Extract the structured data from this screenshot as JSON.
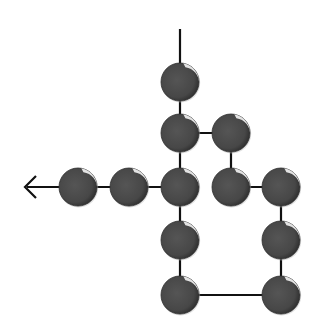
{
  "diagram": {
    "type": "node-chain",
    "width": 324,
    "height": 336,
    "colors": {
      "background": "#ffffff",
      "node_fill": "#4a4a4a",
      "node_dark": "#2e2e2e",
      "node_highlight": "#ffffff",
      "edge": "#111111"
    },
    "node_radius": 19,
    "nodes": [
      {
        "id": "n1",
        "x": 180,
        "y": 82
      },
      {
        "id": "n2",
        "x": 180,
        "y": 133
      },
      {
        "id": "n3",
        "x": 231,
        "y": 133
      },
      {
        "id": "n4",
        "x": 78,
        "y": 187
      },
      {
        "id": "n5",
        "x": 129,
        "y": 187
      },
      {
        "id": "n6",
        "x": 180,
        "y": 187
      },
      {
        "id": "n7",
        "x": 231,
        "y": 187
      },
      {
        "id": "n8",
        "x": 281,
        "y": 187
      },
      {
        "id": "n9",
        "x": 180,
        "y": 240
      },
      {
        "id": "n10",
        "x": 281,
        "y": 240
      },
      {
        "id": "n11",
        "x": 180,
        "y": 295
      },
      {
        "id": "n12",
        "x": 281,
        "y": 295
      }
    ],
    "edges": [
      {
        "x1": 180,
        "y1": 29,
        "x2": 180,
        "y2": 82,
        "kind": "entry-line"
      },
      {
        "x1": 180,
        "y1": 82,
        "x2": 180,
        "y2": 133
      },
      {
        "x1": 180,
        "y1": 133,
        "x2": 231,
        "y2": 133
      },
      {
        "x1": 231,
        "y1": 133,
        "x2": 231,
        "y2": 187
      },
      {
        "x1": 231,
        "y1": 187,
        "x2": 281,
        "y2": 187
      },
      {
        "x1": 281,
        "y1": 187,
        "x2": 281,
        "y2": 240
      },
      {
        "x1": 281,
        "y1": 240,
        "x2": 281,
        "y2": 295
      },
      {
        "x1": 281,
        "y1": 295,
        "x2": 180,
        "y2": 295
      },
      {
        "x1": 180,
        "y1": 295,
        "x2": 180,
        "y2": 240
      },
      {
        "x1": 180,
        "y1": 240,
        "x2": 180,
        "y2": 187
      },
      {
        "x1": 180,
        "y1": 133,
        "x2": 180,
        "y2": 187
      },
      {
        "x1": 180,
        "y1": 187,
        "x2": 129,
        "y2": 187
      },
      {
        "x1": 129,
        "y1": 187,
        "x2": 78,
        "y2": 187
      },
      {
        "x1": 78,
        "y1": 187,
        "x2": 27,
        "y2": 187,
        "kind": "exit-line"
      }
    ],
    "arrow": {
      "tip_x": 25,
      "tip_y": 187,
      "direction": "left",
      "size": 11
    }
  }
}
